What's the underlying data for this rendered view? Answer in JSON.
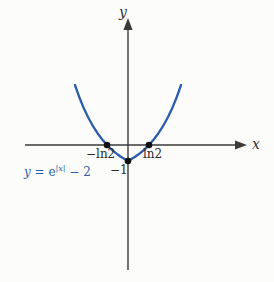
{
  "figure": {
    "background_color": "#fcfcfb",
    "width": 274,
    "height": 282
  },
  "axes": {
    "color": "#3a3a3a",
    "x_axis_label": "x",
    "y_axis_label": "y",
    "origin_px": [
      128,
      145
    ]
  },
  "labels": {
    "x": "x",
    "y": "y",
    "neg_ln2": "−ln2",
    "ln2": "ln2",
    "neg_one": "−1",
    "equation_lhs": "y",
    "equation_eq": " = ",
    "equation_base": "e",
    "equation_exp": "|x|",
    "equation_tail": " − 2",
    "equation_full": "y = e^{|x|} − 2"
  },
  "chart_data": {
    "type": "line",
    "title": "",
    "xlabel": "x",
    "ylabel": "y",
    "grid": false,
    "legend": "none",
    "curve_color": "#2b5cab",
    "point_color": "#111111",
    "xlim": [
      -2.2,
      3.3
    ],
    "ylim": [
      -3.6,
      5.0
    ],
    "functions": [
      {
        "name": "y = e^{|x|} - 2",
        "expression": "exp(abs(x)) - 2",
        "color": "#2b5cab",
        "domain": [
          -1.75,
          1.75
        ],
        "x": [
          -1.75,
          -1.6,
          -1.45,
          -1.3,
          -1.15,
          -1.0,
          -0.85,
          -0.7,
          -0.55,
          -0.4,
          -0.25,
          -0.1,
          0.0,
          0.1,
          0.25,
          0.4,
          0.55,
          0.7,
          0.85,
          1.0,
          1.15,
          1.3,
          1.45,
          1.6,
          1.75
        ],
        "y": [
          3.75,
          2.95,
          2.26,
          1.67,
          1.16,
          0.72,
          0.34,
          0.01,
          -0.27,
          -0.51,
          -0.72,
          -0.89,
          -1.0,
          -0.89,
          -0.72,
          -0.51,
          -0.27,
          0.01,
          0.34,
          0.72,
          1.16,
          1.67,
          2.26,
          2.95,
          3.75
        ]
      }
    ],
    "annotated_points": [
      {
        "label": "−ln2",
        "x": -0.693,
        "y": 0,
        "marker": "filled-circle"
      },
      {
        "label": "ln2",
        "x": 0.693,
        "y": 0,
        "marker": "filled-circle"
      },
      {
        "label": "−1",
        "x": 0,
        "y": -1,
        "marker": "filled-circle"
      }
    ],
    "annotations": [
      {
        "text": "y = e^{|x|} − 2",
        "x": -1.55,
        "y": -1.35,
        "color": "#2b5cab"
      }
    ],
    "x_ticks": [
      -0.693,
      0.693
    ],
    "x_tick_labels": [
      "−ln2",
      "ln2"
    ],
    "y_ticks": [
      -1
    ],
    "y_tick_labels": [
      "−1"
    ]
  }
}
